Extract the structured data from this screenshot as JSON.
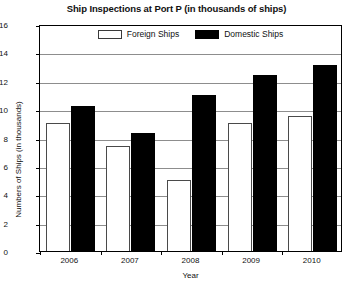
{
  "chart_data": {
    "type": "bar",
    "title": "Ship Inspections at Port P (in thousands of ships)",
    "xlabel": "Year",
    "ylabel": "Numbers of Ships (in thousands)",
    "categories": [
      "2006",
      "2007",
      "2008",
      "2009",
      "2010"
    ],
    "series": [
      {
        "name": "Foreign Ships",
        "color": "#ffffff",
        "values": [
          9.0,
          7.4,
          5.0,
          9.0,
          9.5
        ]
      },
      {
        "name": "Domestic Ships",
        "color": "#000000",
        "values": [
          10.2,
          8.3,
          11.0,
          12.4,
          13.1
        ]
      }
    ],
    "ylim": [
      0,
      16
    ],
    "yticks": [
      0,
      2,
      4,
      6,
      8,
      10,
      12,
      14,
      16
    ],
    "ytick_labels": [
      "0",
      "2",
      "4",
      "6",
      "8",
      "10",
      "12",
      "14",
      "16"
    ],
    "grid": true,
    "grid_axis": "y",
    "legend_position": "top-inside-center"
  }
}
